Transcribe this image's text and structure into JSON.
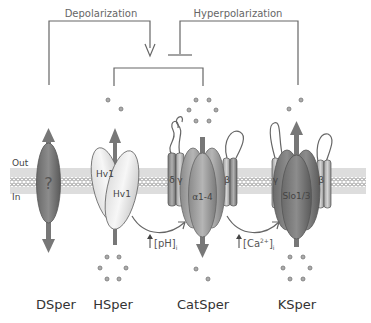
{
  "signals": {
    "depolarization": "Depolarization",
    "hyperpolarization": "Hyperpolarization"
  },
  "membrane": {
    "out_label": "Out",
    "in_label": "In"
  },
  "channels": [
    {
      "name": "DSper",
      "subunit_label": "?"
    },
    {
      "name": "HSper",
      "subunit_labels": [
        "Hv1",
        "Hv1"
      ]
    },
    {
      "name": "CatSper",
      "subunit_labels": [
        "α1-4",
        "δ",
        "γ",
        "β"
      ]
    },
    {
      "name": "KSper",
      "subunit_labels": [
        "Slo1/3",
        "γ",
        "β"
      ]
    }
  ],
  "annotations": {
    "ph": "[pH]",
    "ph_sub": "i",
    "ca": "[Ca",
    "ca_sup": "2+",
    "ca_close": "]",
    "ca_sub": "i"
  }
}
